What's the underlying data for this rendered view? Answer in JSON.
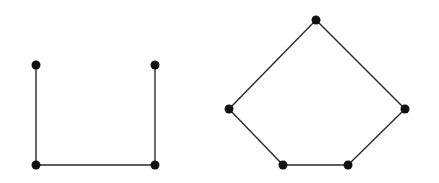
{
  "diagram": {
    "width": 439,
    "height": 183,
    "colors": {
      "edge": "#2a2a2a",
      "node": "#111111",
      "background": "#ffffff"
    },
    "graphs": [
      {
        "name": "path-graph-u-shape",
        "nodes": [
          {
            "id": "a",
            "x": 36,
            "y": 65
          },
          {
            "id": "b",
            "x": 36,
            "y": 165
          },
          {
            "id": "c",
            "x": 155,
            "y": 165
          },
          {
            "id": "d",
            "x": 155,
            "y": 65
          }
        ],
        "edges": [
          [
            "a",
            "b"
          ],
          [
            "b",
            "c"
          ],
          [
            "c",
            "d"
          ]
        ]
      },
      {
        "name": "cycle-graph-pentagon",
        "nodes": [
          {
            "id": "p",
            "x": 316,
            "y": 20
          },
          {
            "id": "q",
            "x": 405,
            "y": 109
          },
          {
            "id": "r",
            "x": 348,
            "y": 165
          },
          {
            "id": "s",
            "x": 283,
            "y": 165
          },
          {
            "id": "t",
            "x": 229,
            "y": 109
          }
        ],
        "edges": [
          [
            "p",
            "q"
          ],
          [
            "q",
            "r"
          ],
          [
            "r",
            "s"
          ],
          [
            "s",
            "t"
          ],
          [
            "t",
            "p"
          ]
        ]
      }
    ]
  }
}
